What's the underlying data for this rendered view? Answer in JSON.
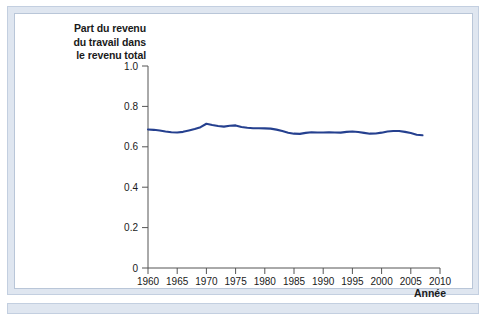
{
  "figure": {
    "frame_color": "#dfe6f0",
    "frame_border_color": "#c3cfe0",
    "panel_background": "#ffffff"
  },
  "chart_data": {
    "type": "line",
    "title": "Part du revenu du travail dans le revenu total",
    "title_lines": [
      "Part du revenu",
      "du travail dans",
      "le revenu total"
    ],
    "xlabel": "Année",
    "ylabel": "",
    "xlim": [
      1960,
      2010
    ],
    "ylim": [
      0,
      1.0
    ],
    "grid": false,
    "legend": null,
    "line_color": "#25408f",
    "line_width": 2.1,
    "xticks": [
      1960,
      1965,
      1970,
      1975,
      1980,
      1985,
      1990,
      1995,
      2000,
      2005,
      2010
    ],
    "xtick_labels": [
      "1960",
      "1965",
      "1970",
      "1975",
      "1980",
      "1985",
      "1990",
      "1995",
      "2000",
      "2005",
      "2010"
    ],
    "yticks": [
      0,
      0.2,
      0.4,
      0.6,
      0.8,
      1.0
    ],
    "ytick_labels": [
      "0",
      "0.2",
      "0.4",
      "0.6",
      "0.8",
      "1.0"
    ],
    "series": [
      {
        "name": "Part du revenu du travail dans le revenu total",
        "x": [
          1960,
          1961,
          1962,
          1963,
          1964,
          1965,
          1966,
          1967,
          1968,
          1969,
          1970,
          1971,
          1972,
          1973,
          1974,
          1975,
          1976,
          1977,
          1978,
          1979,
          1980,
          1981,
          1982,
          1983,
          1984,
          1985,
          1986,
          1987,
          1988,
          1989,
          1990,
          1991,
          1992,
          1993,
          1994,
          1995,
          1996,
          1997,
          1998,
          1999,
          2000,
          2001,
          2002,
          2003,
          2004,
          2005,
          2006,
          2007
        ],
        "values": [
          0.686,
          0.684,
          0.681,
          0.676,
          0.672,
          0.671,
          0.674,
          0.681,
          0.688,
          0.697,
          0.714,
          0.708,
          0.703,
          0.7,
          0.704,
          0.706,
          0.698,
          0.694,
          0.692,
          0.692,
          0.691,
          0.69,
          0.685,
          0.678,
          0.67,
          0.665,
          0.664,
          0.669,
          0.672,
          0.671,
          0.671,
          0.672,
          0.671,
          0.67,
          0.674,
          0.676,
          0.673,
          0.669,
          0.665,
          0.666,
          0.67,
          0.676,
          0.678,
          0.678,
          0.674,
          0.668,
          0.66,
          0.657
        ]
      }
    ]
  }
}
